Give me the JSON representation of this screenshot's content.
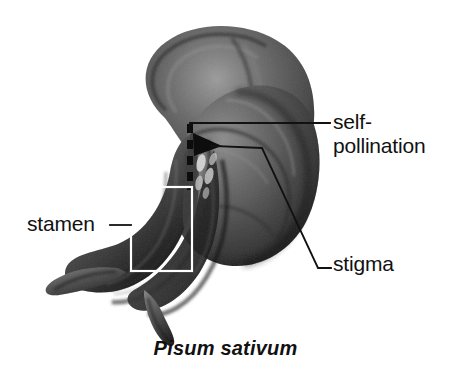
{
  "figure": {
    "background_color": "#ffffff",
    "caption": "Pisum sativum",
    "ink_color": "#111111"
  },
  "labels": {
    "self_pollination": {
      "line1": "self-",
      "line2": "pollination",
      "leader": "horizontal-line-with-left-hook"
    },
    "stigma": {
      "text": "stigma",
      "leader": "polyline-with-hook"
    },
    "stamen": {
      "text": "stamen",
      "leader": "horizontal-line-to-bracket-box"
    }
  },
  "annotations": {
    "stamen_box": "white-rectangle-outline",
    "pollen_path": "black-dashed-line",
    "pollen_arrowhead": "black-triangle-pointing-right"
  },
  "palette": {
    "white": "#ffffff",
    "highlight": "#e8e8e8",
    "light_gray": "#bdbdbd",
    "mid_gray": "#9a9a9a",
    "gray": "#868686",
    "dark_gray": "#6a6a6a",
    "darker_gray": "#555555",
    "shadow": "#3d3d3d",
    "black": "#111111"
  }
}
